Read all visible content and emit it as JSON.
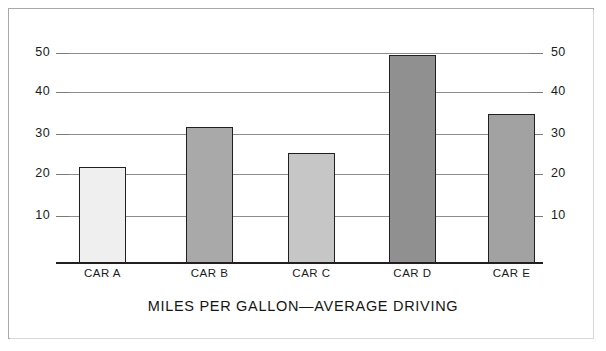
{
  "chart_data": {
    "type": "bar",
    "title": "MILES PER GALLON—AVERAGE DRIVING",
    "xlabel": "",
    "ylabel": "",
    "ylim": [
      0,
      55
    ],
    "grid": true,
    "legend": "none",
    "dual_axis": true,
    "categories": [
      "CAR A",
      "CAR B",
      "CAR C",
      "CAR D",
      "CAR E"
    ],
    "values": [
      22.5,
      31.3,
      25.2,
      48.5,
      34.5
    ],
    "bar_colors": [
      "#efefef",
      "#a9a9a9",
      "#c6c6c6",
      "#909090",
      "#a2a2a2"
    ],
    "bar_edge_color": "#231f20",
    "yticks_left": [
      10,
      20,
      30,
      40,
      50
    ],
    "yticks_right": [
      10,
      20,
      30,
      40,
      50
    ],
    "tick_labels_left": [
      "10",
      "20",
      "30",
      "40",
      "50"
    ],
    "tick_labels_right": [
      "10",
      "20",
      "30",
      "40",
      "50"
    ],
    "gridline_color": "#8d8d8d",
    "axis_color": "#231f20",
    "frame_color": "#a9a9a9",
    "background": "#ffffff"
  },
  "axis": {
    "left": [
      {
        "value": "50",
        "y": 53
      },
      {
        "value": "40",
        "y": 92
      },
      {
        "value": "30",
        "y": 134
      },
      {
        "value": "20",
        "y": 174
      },
      {
        "value": "10",
        "y": 216
      }
    ],
    "right": [
      {
        "value": "50",
        "y": 53
      },
      {
        "value": "40",
        "y": 92
      },
      {
        "value": "30",
        "y": 134
      },
      {
        "value": "20",
        "y": 174
      },
      {
        "value": "10",
        "y": 216
      }
    ]
  },
  "bars": [
    {
      "label": "CAR A",
      "value": 22.5,
      "x": 79,
      "width": 47,
      "top": 167,
      "color": "#efefef"
    },
    {
      "label": "CAR B",
      "value": 31.3,
      "x": 186,
      "width": 47,
      "top": 127,
      "color": "#a9a9a9"
    },
    {
      "label": "CAR C",
      "value": 25.2,
      "x": 288,
      "width": 47,
      "top": 153,
      "color": "#c6c6c6"
    },
    {
      "label": "CAR D",
      "value": 48.5,
      "x": 389,
      "width": 47,
      "top": 55,
      "color": "#909090"
    },
    {
      "label": "CAR E",
      "value": 34.5,
      "x": 488,
      "width": 47,
      "top": 114,
      "color": "#a2a2a2"
    }
  ],
  "caption": {
    "title": "MILES PER GALLON—AVERAGE DRIVING"
  }
}
